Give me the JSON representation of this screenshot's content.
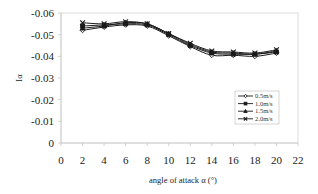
{
  "chart_data": {
    "type": "line",
    "title": "",
    "xlabel": "angle of attack  α (°)",
    "ylabel": "Iα",
    "xlim": [
      0,
      22
    ],
    "ylim": [
      0,
      -0.06
    ],
    "y_inverted": true,
    "x_ticks": [
      0,
      2,
      4,
      6,
      8,
      10,
      12,
      14,
      16,
      18,
      20,
      22
    ],
    "y_ticks": [
      0,
      -0.01,
      -0.02,
      -0.03,
      -0.04,
      -0.05,
      -0.06
    ],
    "y_tick_labels": [
      "0",
      "-0.01",
      "-0.02",
      "-0.03",
      "-0.04",
      "-0.05",
      "-0.06"
    ],
    "grid": false,
    "legend_position": "right-middle inside plot",
    "x": [
      2,
      4,
      6,
      8,
      10,
      12,
      14,
      16,
      18,
      20
    ],
    "series": [
      {
        "name": "0.5m/s",
        "marker": "diamond",
        "values": [
          -0.052,
          -0.0535,
          -0.0545,
          -0.054,
          -0.0495,
          -0.0445,
          -0.0405,
          -0.0405,
          -0.04,
          -0.0415
        ]
      },
      {
        "name": "1.0m/s",
        "marker": "square",
        "values": [
          -0.054,
          -0.0545,
          -0.055,
          -0.0545,
          -0.05,
          -0.045,
          -0.0415,
          -0.041,
          -0.041,
          -0.042
        ]
      },
      {
        "name": "1.5m/s",
        "marker": "triangle",
        "values": [
          -0.053,
          -0.054,
          -0.0555,
          -0.055,
          -0.0505,
          -0.0455,
          -0.042,
          -0.0415,
          -0.041,
          -0.0425
        ]
      },
      {
        "name": "2.0m/s",
        "marker": "x",
        "values": [
          -0.0555,
          -0.055,
          -0.056,
          -0.055,
          -0.0505,
          -0.046,
          -0.0425,
          -0.042,
          -0.0415,
          -0.043
        ]
      }
    ]
  },
  "colors": {
    "line": "#1a1a1a",
    "axis": "#c8c8c8",
    "plot_border": "#d4d4d4",
    "legend_border": "#aaaaaa"
  }
}
